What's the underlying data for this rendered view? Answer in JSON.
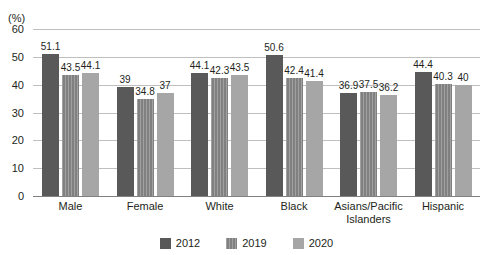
{
  "chart_data": {
    "type": "bar",
    "title": "",
    "xlabel": "",
    "ylabel": "(%)",
    "ylim": [
      0,
      60
    ],
    "yticks": [
      0,
      10,
      20,
      30,
      40,
      50,
      60
    ],
    "ytick_labels": [
      "0",
      "10",
      "20",
      "30",
      "40",
      "50",
      "60"
    ],
    "grid": true,
    "legend_position": "bottom",
    "categories": [
      "Male",
      "Female",
      "White",
      "Black",
      "Asians/Pacific Islanders",
      "Hispanic"
    ],
    "category_lines": [
      [
        "Male"
      ],
      [
        "Female"
      ],
      [
        "White"
      ],
      [
        "Black"
      ],
      [
        "Asians/Pacific",
        "Islanders"
      ],
      [
        "Hispanic"
      ]
    ],
    "series": [
      {
        "name": "2012",
        "color": "#595959",
        "values": [
          51.1,
          39,
          44.1,
          50.6,
          36.9,
          44.4
        ],
        "labels": [
          "51.1",
          "39",
          "44.1",
          "50.6",
          "36.9",
          "44.4"
        ]
      },
      {
        "name": "2019",
        "color": "#808080",
        "values": [
          43.5,
          34.8,
          42.3,
          42.4,
          37.5,
          40.3
        ],
        "labels": [
          "43.5",
          "34.8",
          "42.3",
          "42.4",
          "37.5",
          "40.3"
        ]
      },
      {
        "name": "2020",
        "color": "#a6a6a6",
        "values": [
          44.1,
          37,
          43.5,
          41.4,
          36.2,
          40
        ],
        "labels": [
          "44.1",
          "37",
          "43.5",
          "41.4",
          "36.2",
          "40"
        ]
      }
    ]
  },
  "axis": {
    "unit_label": "(%)"
  },
  "legend": {
    "items": [
      {
        "label": "2012"
      },
      {
        "label": "2019"
      },
      {
        "label": "2020"
      }
    ]
  }
}
